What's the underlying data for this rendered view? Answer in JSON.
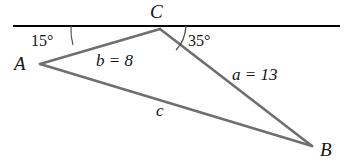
{
  "figure": {
    "type": "triangle-with-transversal-line",
    "colors": {
      "transversal_line": "#000000",
      "triangle_sides": "#6f6f6f",
      "angle_arc": "#4a4a4a",
      "text": "#141414",
      "background": "#ffffff"
    },
    "vertices": [
      {
        "name": "A",
        "label": "A",
        "x": 40,
        "y": 64,
        "label_x": 14,
        "label_y": 54
      },
      {
        "name": "C",
        "label": "C",
        "x": 160,
        "y": 29,
        "label_x": 150,
        "label_y": 2
      },
      {
        "name": "B",
        "label": "B",
        "x": 312,
        "y": 146,
        "label_x": 320,
        "label_y": 140
      }
    ],
    "transversal": {
      "name": "horizontal-line-through-C",
      "x1": 13,
      "y1": 26,
      "x2": 340,
      "y2": 26
    },
    "sides": [
      {
        "name": "side-b",
        "label": "b = 8",
        "from": "C",
        "to": "A",
        "label_x": 96,
        "label_y": 52
      },
      {
        "name": "side-a",
        "label": "a = 13",
        "from": "C",
        "to": "B",
        "label_x": 232,
        "label_y": 66
      },
      {
        "name": "side-c",
        "label": "c",
        "from": "A",
        "to": "B",
        "label_x": 156,
        "label_y": 102
      }
    ],
    "angles": [
      {
        "name": "angle-15",
        "label": "15°",
        "value": 15,
        "unit": "degrees",
        "label_x": 31,
        "label_y": 33
      },
      {
        "name": "angle-35",
        "label": "35°",
        "value": 35,
        "unit": "degrees",
        "label_x": 188,
        "label_y": 33
      }
    ]
  }
}
